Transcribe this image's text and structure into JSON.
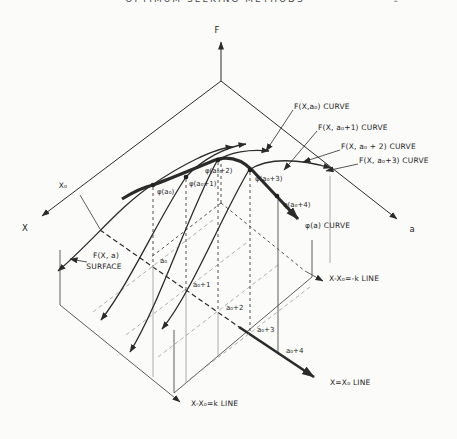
{
  "page": {
    "header_text": "OPTIMUM SEEKING METHODS",
    "page_mark": "1"
  },
  "axes": {
    "f_label": "F",
    "x_label": "X",
    "a_label": "a",
    "x0_tick_label": "X₀"
  },
  "curve_labels": [
    "F(X,a₀) CURVE",
    "F(X, a₀+1) CURVE",
    "F(X, a₀ + 2) CURVE",
    "F(X, a₀+3) CURVE"
  ],
  "phi_points": [
    "φ(a₀)",
    "φ(a₀+1)",
    "φ(a₀+2)",
    "φ(a₀+3)",
    "φ(a₀+4)"
  ],
  "phi_curve_label": "φ(a) CURVE",
  "surface_label": {
    "line1": "F(X, a)",
    "line2": "SURFACE"
  },
  "floor_points": [
    "a₀",
    "a₀+1",
    "a₀+2",
    "a₀+3",
    "a₀+4"
  ],
  "floor_lines": {
    "minus_k": "X-X₀=-k  LINE",
    "x_equals_x0": "X=X₀ LINE",
    "plus_k": "X-X₀=k  LINE"
  },
  "colors": {
    "ink": "#2b2b2b",
    "background": "#fbfbf9"
  }
}
